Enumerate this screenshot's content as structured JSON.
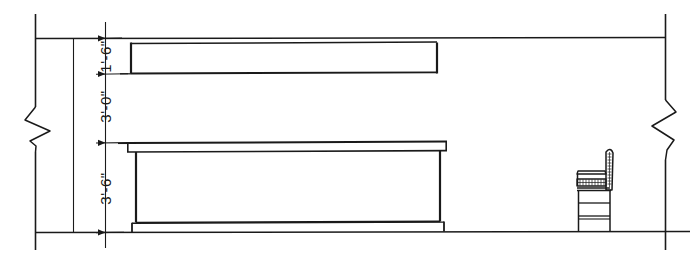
{
  "drawing": {
    "title": "Interior Elevation - Counter and Upper Cabinet",
    "type": "architectural-elevation",
    "line_color": "#1a1a1a",
    "background_color": "#ffffff",
    "dimensions": [
      {
        "name": "soffit-height",
        "label": "1'-6\"",
        "from_y": 38,
        "to_y": 74,
        "rotation": -90
      },
      {
        "name": "backsplash-height",
        "label": "3'-0\"",
        "from_y": 74,
        "to_y": 142,
        "rotation": -90
      },
      {
        "name": "counter-height",
        "label": "3'-6\"",
        "from_y": 142,
        "to_y": 232,
        "rotation": -90
      }
    ],
    "elements": [
      {
        "name": "left-wall-line",
        "kind": "wall"
      },
      {
        "name": "left-break-line",
        "kind": "break-symbol"
      },
      {
        "name": "right-wall-line",
        "kind": "wall"
      },
      {
        "name": "right-break-line",
        "kind": "break-symbol"
      },
      {
        "name": "ceiling-line",
        "kind": "ceiling"
      },
      {
        "name": "floor-line",
        "kind": "floor"
      },
      {
        "name": "upper-cabinet",
        "kind": "casework"
      },
      {
        "name": "counter-top",
        "kind": "casework"
      },
      {
        "name": "counter-body",
        "kind": "casework"
      },
      {
        "name": "counter-toe-kick",
        "kind": "casework"
      },
      {
        "name": "chair",
        "kind": "furniture"
      },
      {
        "name": "extension-line",
        "kind": "annotation"
      },
      {
        "name": "dimension-line",
        "kind": "annotation"
      }
    ]
  }
}
